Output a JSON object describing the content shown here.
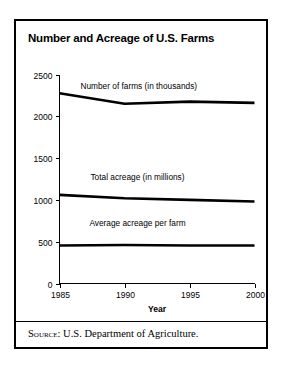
{
  "figure": {
    "title": "Number and Acreage of U.S. Farms",
    "source_label": "Source:",
    "source_text": "U.S. Department of Agriculture."
  },
  "chart_data": {
    "type": "line",
    "title": "Number and Acreage of U.S. Farms",
    "xlabel": "Year",
    "ylabel": "",
    "xlim": [
      1985,
      2000
    ],
    "ylim": [
      0,
      2500
    ],
    "xticks": [
      1985,
      1990,
      1995,
      2000
    ],
    "xtick_labels": [
      "1985",
      "1990",
      "1995",
      "2000"
    ],
    "yticks": [
      0,
      500,
      1000,
      1500,
      2000,
      2500
    ],
    "ytick_labels": [
      "0",
      "500",
      "1000",
      "1500",
      "2000",
      "2500"
    ],
    "grid": false,
    "legend": "inline-labels",
    "x": [
      1985,
      1990,
      1995,
      2000
    ],
    "series": [
      {
        "name": "Number of farms (in thousands)",
        "values": [
          2275,
          2150,
          2175,
          2160
        ],
        "label_x": 1991.1,
        "label_y": 2330
      },
      {
        "name": "Total acreage (in millions)",
        "values": [
          1060,
          1020,
          1000,
          980
        ],
        "label_x": 1991.0,
        "label_y": 1240
      },
      {
        "name": "Average acreage per farm",
        "values": [
          455,
          460,
          455,
          455
        ],
        "label_x": 1991.0,
        "label_y": 690
      }
    ]
  }
}
